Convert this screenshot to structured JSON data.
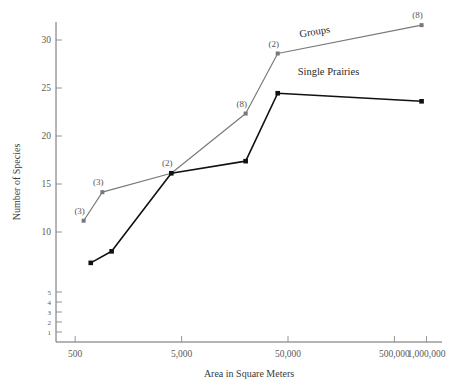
{
  "chart_data": {
    "type": "line",
    "title": "",
    "xlabel": "Area in Square Meters",
    "ylabel": "Number of Species",
    "xscale": "log",
    "yscale": "log",
    "grid": false,
    "legend_position": "inline-annotation",
    "xticks": [
      "500",
      "5,000",
      "50,000",
      "500,000",
      "1,000,000"
    ],
    "xtick_values": [
      500,
      5000,
      50000,
      500000,
      1000000
    ],
    "yticks": [
      "30",
      "25",
      "20",
      "15",
      "10",
      "5",
      "4",
      "3",
      "2",
      "1"
    ],
    "ytick_values": [
      30,
      25,
      20,
      15,
      10,
      5,
      4,
      3,
      2,
      1
    ],
    "xlim": [
      330,
      1400000
    ],
    "ylim": [
      1,
      33
    ],
    "series": [
      {
        "name": "Groups",
        "color": "#787878",
        "x": [
          600,
          900,
          4000,
          20000,
          40000,
          900000
        ],
        "y": [
          11.0,
          14.0,
          16.0,
          22.2,
          28.5,
          31.5
        ],
        "point_labels": [
          "(3)",
          "(3)",
          "(2)",
          "(8)",
          "(2)",
          "(8)"
        ]
      },
      {
        "name": "Single Prairies",
        "color": "#111111",
        "x": [
          700,
          1100,
          4000,
          20000,
          40000,
          900000
        ],
        "y": [
          7.0,
          8.0,
          16.0,
          17.2,
          24.4,
          23.5
        ],
        "point_labels": [
          "",
          "",
          "",
          "",
          "",
          ""
        ]
      }
    ],
    "annotations": [
      {
        "text": "Groups",
        "x": 90000,
        "y": 30.5,
        "rotation": -9
      },
      {
        "text": "Single Prairies",
        "x": 120000,
        "y": 26.3,
        "rotation": 0
      }
    ]
  }
}
